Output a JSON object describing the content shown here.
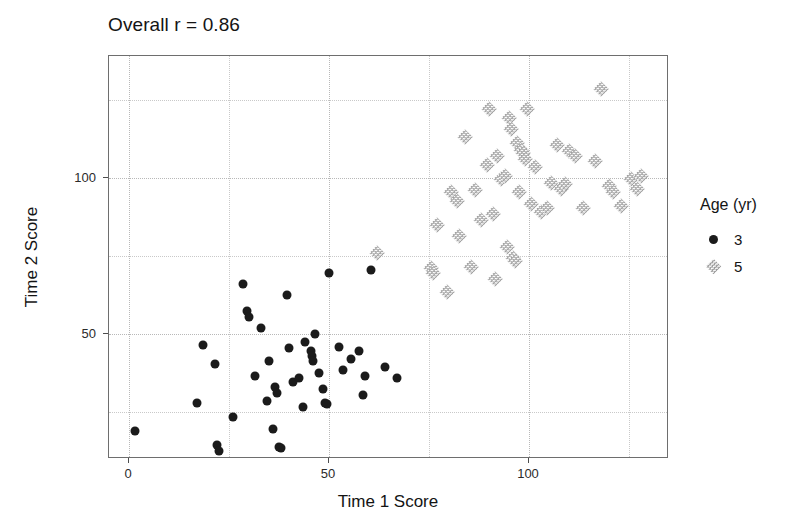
{
  "chart_data": {
    "type": "scatter",
    "title": "Overall r = 0.86",
    "xlabel": "Time 1 Score",
    "ylabel": "Time 2 Score",
    "xlim": [
      -5,
      135
    ],
    "ylim": [
      10,
      139
    ],
    "x_ticks": [
      0,
      50,
      100
    ],
    "y_ticks": [
      50,
      100
    ],
    "x_minor_gridlines": [
      25,
      75,
      125
    ],
    "y_minor_gridlines": [
      25,
      75,
      125
    ],
    "grid": true,
    "legend_title": "Age (yr)",
    "legend_position": "right",
    "series": [
      {
        "name": "3",
        "marker": "filled-circle",
        "color": "#1b1b1b",
        "points": [
          [
            1.5,
            19.0
          ],
          [
            17.0,
            28.0
          ],
          [
            18.5,
            46.5
          ],
          [
            21.5,
            40.5
          ],
          [
            22.0,
            14.5
          ],
          [
            22.5,
            12.5
          ],
          [
            26.0,
            23.5
          ],
          [
            28.5,
            66.0
          ],
          [
            29.5,
            57.5
          ],
          [
            30.0,
            55.5
          ],
          [
            31.5,
            36.5
          ],
          [
            33.0,
            52.0
          ],
          [
            34.5,
            28.5
          ],
          [
            35.0,
            41.5
          ],
          [
            36.0,
            19.5
          ],
          [
            36.5,
            33.0
          ],
          [
            37.0,
            31.0
          ],
          [
            37.5,
            14.0
          ],
          [
            38.0,
            13.5
          ],
          [
            39.5,
            62.5
          ],
          [
            40.0,
            45.5
          ],
          [
            41.0,
            34.5
          ],
          [
            42.5,
            36.0
          ],
          [
            43.5,
            26.5
          ],
          [
            44.0,
            47.5
          ],
          [
            45.5,
            44.5
          ],
          [
            45.8,
            43.0
          ],
          [
            46.0,
            41.5
          ],
          [
            46.5,
            50.0
          ],
          [
            47.5,
            37.5
          ],
          [
            48.5,
            32.5
          ],
          [
            49.0,
            28.0
          ],
          [
            49.5,
            27.5
          ],
          [
            50.0,
            69.5
          ],
          [
            52.5,
            46.0
          ],
          [
            53.5,
            38.5
          ],
          [
            55.5,
            42.0
          ],
          [
            57.5,
            44.5
          ],
          [
            58.5,
            30.5
          ],
          [
            59.0,
            36.5
          ],
          [
            60.5,
            70.5
          ],
          [
            64.0,
            39.5
          ],
          [
            67.0,
            36.0
          ]
        ]
      },
      {
        "name": "5",
        "marker": "dotted-diamond",
        "color": "#9a9a9a",
        "points": [
          [
            62.0,
            76.0
          ],
          [
            75.5,
            71.0
          ],
          [
            76.0,
            69.5
          ],
          [
            77.0,
            85.0
          ],
          [
            79.5,
            63.5
          ],
          [
            80.5,
            95.5
          ],
          [
            82.0,
            92.5
          ],
          [
            82.5,
            81.5
          ],
          [
            84.0,
            113.0
          ],
          [
            85.5,
            71.5
          ],
          [
            86.5,
            96.0
          ],
          [
            88.0,
            86.5
          ],
          [
            89.5,
            104.0
          ],
          [
            90.0,
            122.0
          ],
          [
            91.0,
            88.5
          ],
          [
            91.5,
            67.5
          ],
          [
            92.0,
            107.0
          ],
          [
            93.0,
            99.5
          ],
          [
            94.0,
            100.5
          ],
          [
            94.5,
            78.0
          ],
          [
            95.0,
            119.0
          ],
          [
            95.5,
            115.5
          ],
          [
            96.0,
            74.5
          ],
          [
            96.5,
            73.5
          ],
          [
            97.0,
            111.0
          ],
          [
            97.5,
            95.5
          ],
          [
            98.0,
            109.0
          ],
          [
            98.5,
            108.0
          ],
          [
            99.0,
            106.0
          ],
          [
            99.5,
            122.0
          ],
          [
            100.5,
            91.5
          ],
          [
            101.5,
            103.5
          ],
          [
            103.0,
            89.0
          ],
          [
            104.5,
            90.5
          ],
          [
            105.5,
            98.5
          ],
          [
            107.0,
            110.5
          ],
          [
            108.0,
            96.5
          ],
          [
            109.0,
            98.0
          ],
          [
            110.0,
            108.5
          ],
          [
            111.5,
            107.0
          ],
          [
            113.5,
            90.5
          ],
          [
            116.5,
            105.5
          ],
          [
            118.0,
            128.5
          ],
          [
            120.0,
            97.5
          ],
          [
            121.0,
            95.5
          ],
          [
            123.0,
            91.0
          ],
          [
            125.5,
            99.5
          ],
          [
            127.0,
            96.5
          ],
          [
            128.0,
            100.5
          ]
        ]
      }
    ]
  },
  "axis": {
    "x_tick_labels": [
      "0",
      "50",
      "100"
    ],
    "y_tick_labels": [
      "50",
      "100"
    ]
  }
}
